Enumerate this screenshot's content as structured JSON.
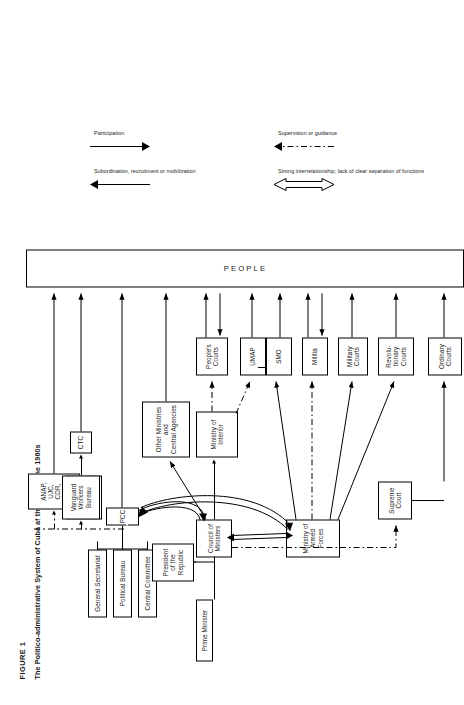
{
  "figure": {
    "label": "FIGURE 1",
    "title": "The Politico-administrative System of Cuba at the End of the 1960s"
  },
  "nodes": {
    "general_secretariat": "General Secretariat",
    "political_bureau": "Political Bureau",
    "central_committee": "Central Committee",
    "pcc": "PCC",
    "vanguard_workers_bureau": "Vanguard\nWorkers\nBureau",
    "ctc": "CTC",
    "mass_organizations": "ANAP,\nUJC,\nCDR,\nFMC",
    "prime_minister": "Prime Minister",
    "president_republic": "President\nof the\nRepublic",
    "council_of_ministers": "Council of\nMinisters",
    "other_ministries": "Other Ministries\nand\nCentral Agencies",
    "ministry_of_interior": "Ministry of\nInterior",
    "ministry_armed_forces": "Ministry of\nArmed Forces",
    "peoples_courts": "People's\nCourts",
    "umap": "UMAP",
    "smo": "SMO",
    "militia": "Militia",
    "military_courts": "Military\nCourts",
    "revolutionary_courts": "Revolu-\ntionary\nCourts",
    "supreme_court": "Supreme\nCourt",
    "ordinary_courts": "Ordinary\nCourts",
    "people": "PEOPLE"
  },
  "legend": {
    "items": [
      {
        "symbol": "double-headed-open-arrow",
        "text": "Strong interrelationship; lack of clear separation of functions"
      },
      {
        "symbol": "dash-dot-arrow",
        "text": "Supervision or guidance"
      },
      {
        "symbol": "solid-arrow-right",
        "text": "Subordination, recruitment or mobilization"
      },
      {
        "symbol": "solid-arrow-left",
        "text": "Participation"
      }
    ]
  },
  "colors": {
    "ink": "#000000",
    "paper": "#ffffff"
  }
}
